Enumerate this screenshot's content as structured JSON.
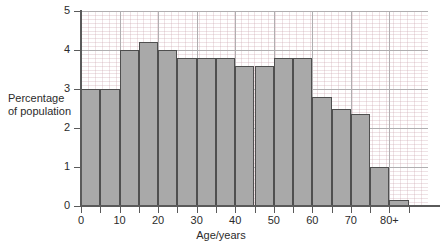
{
  "chart_data": {
    "type": "bar",
    "title": "",
    "subtitle": "",
    "xlabel": "Age/years",
    "ylabel_line1": "Percentage",
    "ylabel_line2": "of population",
    "ylabel": "Percentage of population",
    "xlim": [
      0,
      90
    ],
    "ylim": [
      0,
      5
    ],
    "grid": true,
    "legend": "none",
    "bin_width": 5,
    "x_tick_labels": [
      "0",
      "10",
      "20",
      "30",
      "40",
      "50",
      "60",
      "70",
      "80+"
    ],
    "x_tick_values": [
      0,
      10,
      20,
      30,
      40,
      50,
      60,
      70,
      80
    ],
    "y_tick_labels": [
      "0",
      "1",
      "2",
      "3",
      "4",
      "5"
    ],
    "y_tick_values": [
      0,
      1,
      2,
      3,
      4,
      5
    ],
    "categories": [
      "0-5",
      "5-10",
      "10-15",
      "15-20",
      "20-25",
      "25-30",
      "30-35",
      "35-40",
      "40-45",
      "45-50",
      "50-55",
      "55-60",
      "60-65",
      "65-70",
      "70-75",
      "75-80",
      "80+"
    ],
    "bin_starts": [
      0,
      5,
      10,
      15,
      20,
      25,
      30,
      35,
      40,
      45,
      50,
      55,
      60,
      65,
      70,
      75,
      80
    ],
    "values": [
      3.0,
      3.0,
      4.0,
      4.2,
      4.0,
      3.8,
      3.8,
      3.8,
      3.6,
      3.6,
      3.8,
      3.8,
      2.8,
      2.5,
      2.35,
      1.0,
      0.15
    ]
  },
  "style": {
    "bar_fill": "#a9a9a9",
    "bar_stroke": "#4f4f4f",
    "axis_color": "#5a5a5a",
    "major_grid_color": "#b0aeb0",
    "fine_grid_color": "#c8a0aa",
    "text_color": "#2b2b2b",
    "background": "#ffffff"
  }
}
